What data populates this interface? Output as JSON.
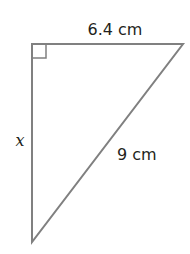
{
  "diagram": {
    "type": "right-triangle",
    "labels": {
      "top_side": "6.4 cm",
      "left_side": "x",
      "hypotenuse": "9 cm"
    },
    "right_angle_marker": true,
    "stroke_color": "#808080",
    "text_color": "#231f20"
  }
}
